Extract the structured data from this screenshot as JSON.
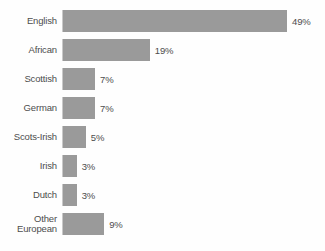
{
  "chart_data": {
    "type": "bar",
    "orientation": "horizontal",
    "title": "",
    "subtitle": "",
    "xlabel": "",
    "ylabel": "",
    "grid": false,
    "legend": false,
    "legend_position": "none",
    "axis_line": "left",
    "xlim": [
      0,
      49
    ],
    "value_suffix": "%",
    "bar_color": "#9a9a9a",
    "text_color": "#4d4d4d",
    "background_color": "#fefefe",
    "categories": [
      "English",
      "African",
      "Scottish",
      "German",
      "Scots-Irish",
      "Irish",
      "Dutch",
      "Other\nEuropean"
    ],
    "values": [
      49,
      19,
      7,
      7,
      5,
      3,
      3,
      9
    ],
    "value_labels": [
      "49%",
      "19%",
      "7%",
      "7%",
      "5%",
      "3%",
      "3%",
      "9%"
    ],
    "bars": [
      {
        "label": "English",
        "value": 49,
        "value_label": "49%"
      },
      {
        "label": "African",
        "value": 19,
        "value_label": "19%"
      },
      {
        "label": "Scottish",
        "value": 7,
        "value_label": "7%"
      },
      {
        "label": "German",
        "value": 7,
        "value_label": "7%"
      },
      {
        "label": "Scots-Irish",
        "value": 5,
        "value_label": "5%"
      },
      {
        "label": "Irish",
        "value": 3,
        "value_label": "3%"
      },
      {
        "label": "Dutch",
        "value": 3,
        "value_label": "3%"
      },
      {
        "label": "Other\nEuropean",
        "value": 9,
        "value_label": "9%"
      }
    ]
  }
}
